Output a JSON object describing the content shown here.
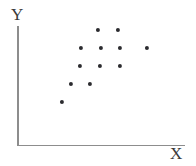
{
  "figure": {
    "background_color": "#ffffff",
    "axis_color": "#8d8d8d",
    "point_color": "#2b2b2f",
    "width": 196,
    "height": 166
  },
  "axes": {
    "y_label": "Y",
    "x_label": "X",
    "y_axis_name": "y-axis-line",
    "x_axis_name": "x-axis-line"
  },
  "chart_data": {
    "type": "scatter",
    "title": "",
    "xlabel": "X",
    "ylabel": "Y",
    "grid": false,
    "legend": null,
    "xlim": [
      0,
      10
    ],
    "ylim": [
      0,
      10
    ],
    "tick_labels": {
      "x": [],
      "y": []
    },
    "series": [
      {
        "name": "points",
        "marker": "circle",
        "color": "#2b2b2f",
        "x": [
          5.1,
          6.3,
          4.0,
          5.3,
          6.4,
          8.1,
          3.9,
          5.2,
          6.4,
          3.2,
          4.4,
          2.7
        ],
        "y": [
          7.8,
          7.8,
          6.3,
          6.3,
          6.3,
          6.3,
          4.8,
          4.8,
          4.8,
          3.3,
          3.3,
          1.8
        ]
      }
    ],
    "points_px": [
      {
        "x": 98,
        "y": 30
      },
      {
        "x": 118,
        "y": 30
      },
      {
        "x": 81,
        "y": 48
      },
      {
        "x": 101,
        "y": 48
      },
      {
        "x": 120,
        "y": 48
      },
      {
        "x": 147,
        "y": 48
      },
      {
        "x": 80,
        "y": 66
      },
      {
        "x": 100,
        "y": 66
      },
      {
        "x": 120,
        "y": 66
      },
      {
        "x": 71,
        "y": 84
      },
      {
        "x": 90,
        "y": 84
      },
      {
        "x": 62,
        "y": 102
      }
    ],
    "point_count": 12
  }
}
